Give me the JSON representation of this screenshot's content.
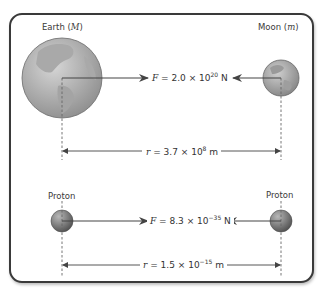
{
  "diagram": {
    "colors": {
      "frame": "#3a3a3a",
      "arrow": "#444444",
      "earth": "#9a9a9a",
      "moon": "#8c8c8c",
      "proton": "#6f6f6f",
      "dashed": "#666666"
    },
    "top_example": {
      "left_body": {
        "name": "Earth",
        "symbol": "M",
        "label_text": "Earth (",
        "label_close": ")"
      },
      "right_body": {
        "name": "Moon",
        "symbol": "m",
        "label_text": "Moon (",
        "label_close": ")"
      },
      "force": {
        "symbol": "F",
        "eq": " = 2.0 × 10",
        "exponent": "20",
        "unit": " N"
      },
      "distance": {
        "symbol": "r",
        "eq": " = 3.7 × 10",
        "exponent": "8",
        "unit": " m"
      }
    },
    "bottom_example": {
      "left_body": {
        "name": "Proton",
        "label_text": "Proton"
      },
      "right_body": {
        "name": "Proton",
        "label_text": "Proton"
      },
      "force": {
        "symbol": "F",
        "eq": " = 8.3 × 10",
        "exponent": "−35",
        "unit": " N"
      },
      "distance": {
        "symbol": "r",
        "eq": " = 1.5 × 10",
        "exponent": "−15",
        "unit": " m"
      }
    }
  }
}
